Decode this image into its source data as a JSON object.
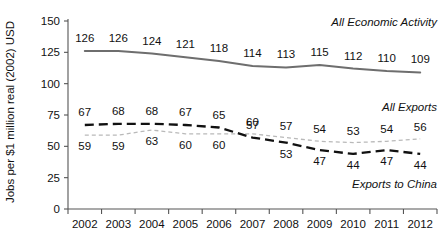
{
  "chart_data": {
    "type": "line",
    "title": "",
    "xlabel": "",
    "ylabel": "Jobs per $1 million real (2002) USD",
    "ylim": [
      0,
      150
    ],
    "yticks": [
      0,
      25,
      50,
      75,
      100,
      125,
      150
    ],
    "grid": false,
    "legend_position": "inline-right",
    "categories": [
      "2002",
      "2003",
      "2004",
      "2005",
      "2006",
      "2007",
      "2008",
      "2009",
      "2010",
      "2011",
      "2012"
    ],
    "series": [
      {
        "name": "All Economic Activity",
        "style": "solid",
        "color": "#6e6e6e",
        "label_position": "above-line",
        "values": [
          126,
          126,
          124,
          121,
          118,
          114,
          113,
          115,
          112,
          110,
          109
        ]
      },
      {
        "name": "Exports to China",
        "style": "dashed-bold",
        "color": "#111111",
        "label_position": "above-line-then-below",
        "values": [
          67,
          68,
          68,
          67,
          65,
          57,
          53,
          47,
          44,
          47,
          44
        ]
      },
      {
        "name": "All Exports",
        "style": "dotted-light",
        "color": "#b9b9b9",
        "label_position": "below-line-then-above",
        "values": [
          59,
          59,
          63,
          60,
          60,
          60,
          57,
          54,
          53,
          54,
          56
        ]
      }
    ],
    "annotations": [
      {
        "text": "All Economic Activity",
        "series": "All Economic Activity"
      },
      {
        "text": "All Exports",
        "series": "All Exports"
      },
      {
        "text": "Exports to China",
        "series": "Exports to China"
      }
    ]
  }
}
